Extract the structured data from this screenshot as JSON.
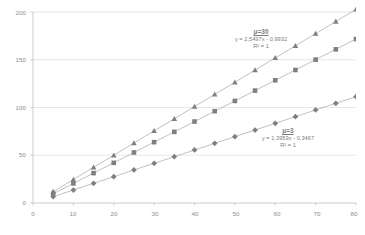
{
  "chart_data": {
    "type": "scatter",
    "title": "",
    "xlabel": "",
    "ylabel": "",
    "xlim": [
      0,
      80
    ],
    "ylim": [
      0,
      200
    ],
    "xticks": [
      0,
      10,
      20,
      30,
      40,
      50,
      60,
      70,
      80
    ],
    "yticks": [
      0,
      50,
      100,
      150,
      200
    ],
    "grid": "horizontal",
    "legend": "none",
    "marker_color": "#7f7f7f",
    "line_color": "#a6a6a6",
    "gridline_color": "#d9d9d9",
    "axis_color": "#bfbfbf",
    "x": [
      5,
      10,
      15,
      20,
      25,
      30,
      35,
      40,
      45,
      50,
      55,
      60,
      65,
      70,
      75,
      80
    ],
    "series": [
      {
        "name": "mu=30",
        "marker": "triangle",
        "values": [
          11.8,
          24.6,
          37.3,
          50.0,
          62.8,
          75.5,
          88.2,
          101.0,
          113.7,
          126.4,
          139.2,
          151.9,
          164.6,
          177.4,
          190.1,
          202.8
        ]
      },
      {
        "name": "middle-series",
        "marker": "square",
        "values": [
          9.7,
          20.5,
          31.3,
          42.1,
          52.9,
          63.7,
          74.5,
          85.3,
          96.1,
          106.9,
          117.7,
          128.5,
          139.3,
          150.1,
          160.9,
          171.7
        ]
      },
      {
        "name": "mu=3",
        "marker": "diamond",
        "values": [
          6.6,
          13.6,
          20.6,
          27.6,
          34.6,
          41.5,
          48.5,
          55.5,
          62.5,
          69.5,
          76.4,
          83.4,
          90.4,
          97.4,
          104.4,
          111.3
        ]
      }
    ],
    "annotations": [
      {
        "id": "mu30",
        "header": "μ=30",
        "equation": "y = 2,5497x - 0,9932",
        "r_squared": "R² = 1"
      },
      {
        "id": "mu3",
        "header": "μ=3",
        "equation": "y = 1,3959x - 0,3467",
        "r_squared": "R² = 1"
      }
    ]
  },
  "axes": {
    "y_tick_labels": [
      "0",
      "50",
      "100",
      "150",
      "200"
    ],
    "x_tick_labels": [
      "0",
      "10",
      "20",
      "30",
      "40",
      "50",
      "60",
      "70",
      "80"
    ]
  }
}
